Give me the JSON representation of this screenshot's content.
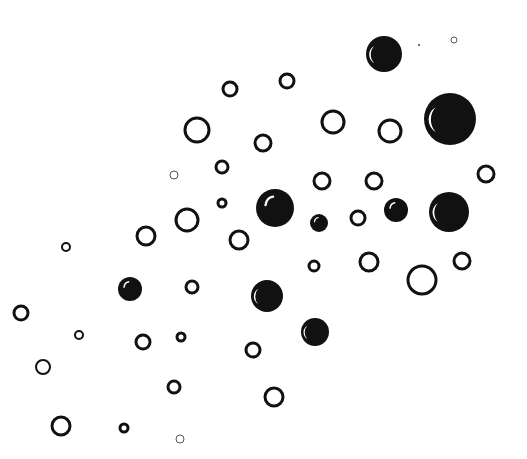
{
  "canvas": {
    "width": 527,
    "height": 459,
    "background": "#ffffff",
    "ink": "#111111"
  },
  "bubbles": [
    {
      "x": 384,
      "y": 54,
      "r": 18,
      "type": "filled",
      "highlight": "left-crescent"
    },
    {
      "x": 419,
      "y": 45,
      "r": 1,
      "type": "dot"
    },
    {
      "x": 454,
      "y": 40,
      "r": 3,
      "type": "hollow",
      "stroke": 1
    },
    {
      "x": 450,
      "y": 119,
      "r": 26,
      "type": "filled",
      "highlight": "left-crescent"
    },
    {
      "x": 390,
      "y": 131,
      "r": 11,
      "type": "hollow",
      "stroke": 3
    },
    {
      "x": 287,
      "y": 81,
      "r": 7,
      "type": "hollow",
      "stroke": 3
    },
    {
      "x": 230,
      "y": 89,
      "r": 7,
      "type": "hollow",
      "stroke": 3
    },
    {
      "x": 197,
      "y": 130,
      "r": 12,
      "type": "hollow",
      "stroke": 3
    },
    {
      "x": 333,
      "y": 122,
      "r": 11,
      "type": "hollow",
      "stroke": 3
    },
    {
      "x": 263,
      "y": 143,
      "r": 8,
      "type": "hollow",
      "stroke": 3
    },
    {
      "x": 222,
      "y": 167,
      "r": 6,
      "type": "hollow",
      "stroke": 3
    },
    {
      "x": 174,
      "y": 175,
      "r": 4,
      "type": "hollow",
      "stroke": 1
    },
    {
      "x": 486,
      "y": 174,
      "r": 8,
      "type": "hollow",
      "stroke": 3
    },
    {
      "x": 322,
      "y": 181,
      "r": 8,
      "type": "hollow",
      "stroke": 3
    },
    {
      "x": 374,
      "y": 181,
      "r": 8,
      "type": "hollow",
      "stroke": 3
    },
    {
      "x": 222,
      "y": 203,
      "r": 4,
      "type": "hollow",
      "stroke": 3
    },
    {
      "x": 275,
      "y": 208,
      "r": 19,
      "type": "filled",
      "highlight": "top-streak"
    },
    {
      "x": 319,
      "y": 223,
      "r": 9,
      "type": "filled",
      "highlight": "top-streak"
    },
    {
      "x": 358,
      "y": 218,
      "r": 7,
      "type": "hollow",
      "stroke": 3
    },
    {
      "x": 396,
      "y": 210,
      "r": 12,
      "type": "filled",
      "highlight": "top-streak"
    },
    {
      "x": 449,
      "y": 212,
      "r": 20,
      "type": "filled",
      "highlight": "left-crescent"
    },
    {
      "x": 187,
      "y": 220,
      "r": 11,
      "type": "hollow",
      "stroke": 3
    },
    {
      "x": 146,
      "y": 236,
      "r": 9,
      "type": "hollow",
      "stroke": 3
    },
    {
      "x": 239,
      "y": 240,
      "r": 9,
      "type": "hollow",
      "stroke": 3
    },
    {
      "x": 66,
      "y": 247,
      "r": 4,
      "type": "hollow",
      "stroke": 2
    },
    {
      "x": 314,
      "y": 266,
      "r": 5,
      "type": "hollow",
      "stroke": 3
    },
    {
      "x": 369,
      "y": 262,
      "r": 9,
      "type": "hollow",
      "stroke": 3
    },
    {
      "x": 462,
      "y": 261,
      "r": 8,
      "type": "hollow",
      "stroke": 3
    },
    {
      "x": 422,
      "y": 280,
      "r": 14,
      "type": "hollow",
      "stroke": 3
    },
    {
      "x": 130,
      "y": 289,
      "r": 12,
      "type": "filled",
      "highlight": "top-streak"
    },
    {
      "x": 192,
      "y": 287,
      "r": 6,
      "type": "hollow",
      "stroke": 3
    },
    {
      "x": 267,
      "y": 296,
      "r": 16,
      "type": "filled",
      "highlight": "left-crescent"
    },
    {
      "x": 21,
      "y": 313,
      "r": 7,
      "type": "hollow",
      "stroke": 3
    },
    {
      "x": 79,
      "y": 335,
      "r": 4,
      "type": "hollow",
      "stroke": 2
    },
    {
      "x": 143,
      "y": 342,
      "r": 7,
      "type": "hollow",
      "stroke": 3
    },
    {
      "x": 181,
      "y": 337,
      "r": 4,
      "type": "hollow",
      "stroke": 3
    },
    {
      "x": 315,
      "y": 332,
      "r": 14,
      "type": "filled",
      "highlight": "left-crescent"
    },
    {
      "x": 253,
      "y": 350,
      "r": 7,
      "type": "hollow",
      "stroke": 3
    },
    {
      "x": 43,
      "y": 367,
      "r": 7,
      "type": "hollow",
      "stroke": 2
    },
    {
      "x": 174,
      "y": 387,
      "r": 6,
      "type": "hollow",
      "stroke": 3
    },
    {
      "x": 274,
      "y": 397,
      "r": 9,
      "type": "hollow",
      "stroke": 3
    },
    {
      "x": 61,
      "y": 426,
      "r": 9,
      "type": "hollow",
      "stroke": 3
    },
    {
      "x": 124,
      "y": 428,
      "r": 4,
      "type": "hollow",
      "stroke": 3
    },
    {
      "x": 180,
      "y": 439,
      "r": 4,
      "type": "hollow",
      "stroke": 1
    }
  ]
}
